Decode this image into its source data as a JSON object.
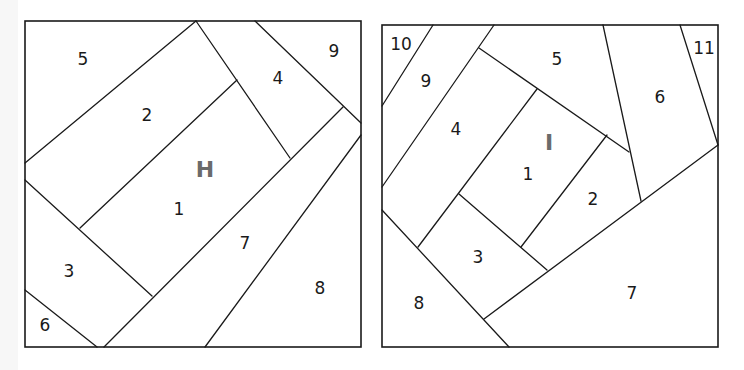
{
  "diagrams": [
    {
      "letter": "H",
      "pieces": [
        {
          "label": "1",
          "x": 179,
          "y": 210
        },
        {
          "label": "2",
          "x": 147,
          "y": 116
        },
        {
          "label": "3",
          "x": 69,
          "y": 272
        },
        {
          "label": "4",
          "x": 278,
          "y": 79
        },
        {
          "label": "5",
          "x": 83,
          "y": 60
        },
        {
          "label": "6",
          "x": 45,
          "y": 326
        },
        {
          "label": "7",
          "x": 245,
          "y": 244
        },
        {
          "label": "8",
          "x": 320,
          "y": 289
        },
        {
          "label": "9",
          "x": 334,
          "y": 52
        }
      ]
    },
    {
      "letter": "I",
      "pieces": [
        {
          "label": "1",
          "x": 528,
          "y": 175
        },
        {
          "label": "2",
          "x": 593,
          "y": 200
        },
        {
          "label": "3",
          "x": 478,
          "y": 258
        },
        {
          "label": "4",
          "x": 456,
          "y": 130
        },
        {
          "label": "5",
          "x": 557,
          "y": 60
        },
        {
          "label": "6",
          "x": 660,
          "y": 98
        },
        {
          "label": "7",
          "x": 632,
          "y": 294
        },
        {
          "label": "8",
          "x": 419,
          "y": 304
        },
        {
          "label": "9",
          "x": 426,
          "y": 82
        },
        {
          "label": "10",
          "x": 401,
          "y": 45
        },
        {
          "label": "11",
          "x": 704,
          "y": 49
        }
      ]
    }
  ]
}
